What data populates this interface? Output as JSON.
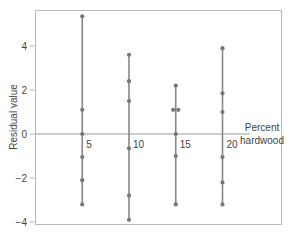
{
  "chart_data": {
    "type": "scatter",
    "title": "",
    "xlabel": "Percent hardwood",
    "xlabel_lines": [
      "Percent",
      "hardwood"
    ],
    "ylabel": "Residual value",
    "ylim": [
      -4,
      5.6
    ],
    "xlim": [
      0,
      22
    ],
    "y_ticks": [
      4,
      2,
      0,
      -2,
      -4
    ],
    "y_tick_labels": [
      "4",
      "2",
      "0",
      "−2",
      "−4"
    ],
    "x_ticks": [
      5,
      10,
      15,
      20
    ],
    "x_tick_labels": [
      "5",
      "10",
      "15",
      "20"
    ],
    "grid": false,
    "legend": null,
    "style": {
      "point_color": "#777777",
      "line_color": "#888888",
      "frame_color": "#b0b0b0",
      "zero_line_color": "#999999"
    },
    "series": [
      {
        "x": 5,
        "residuals": [
          5.35,
          1.1,
          0.0,
          -1.05,
          -2.1,
          -3.2
        ]
      },
      {
        "x": 10,
        "residuals": [
          3.6,
          2.4,
          1.5,
          -0.65,
          -2.8,
          -3.9
        ]
      },
      {
        "x": 15,
        "residuals": [
          2.2,
          1.1,
          1.1,
          0.0,
          -1.0,
          -3.2
        ]
      },
      {
        "x": 20,
        "residuals": [
          3.9,
          1.85,
          1.0,
          -1.05,
          -2.2,
          -3.2
        ]
      }
    ]
  }
}
